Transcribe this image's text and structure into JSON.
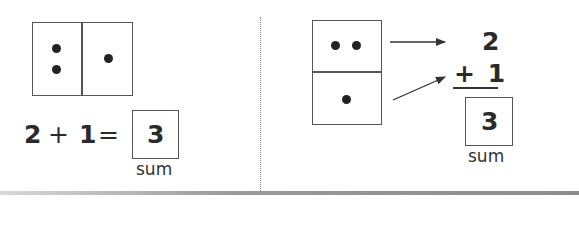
{
  "colors": {
    "ink": "#222222",
    "box_border": "#555555",
    "divider": "#8a8a8a",
    "background": "#ffffff"
  },
  "left_panel": {
    "domino": {
      "orientation": "horizontal",
      "left_half_dots": 2,
      "right_half_dots": 1
    },
    "equation": {
      "addend_1": "2",
      "operator_plus": "+",
      "addend_2": "1",
      "operator_equals": "=",
      "sum_value": "3",
      "sum_label": "sum"
    }
  },
  "right_panel": {
    "domino": {
      "orientation": "vertical",
      "top_half_dots": 2,
      "bottom_half_dots": 1
    },
    "vertical_equation": {
      "addend_1": "2",
      "addend_2_line": "+ 1",
      "sum_value": "3",
      "sum_label": "sum"
    },
    "arrows": [
      {
        "from": "top-half",
        "to": "addend-1"
      },
      {
        "from": "bottom-half",
        "to": "addend-2"
      }
    ]
  }
}
